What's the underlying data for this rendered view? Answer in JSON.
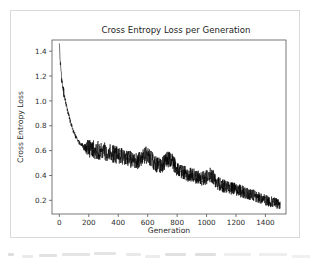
{
  "figure": {
    "background_color": "#ffffff",
    "border_color": "#d9d9d9"
  },
  "chart_data": {
    "type": "line",
    "title": "Cross Entropy Loss per Generation",
    "xlabel": "Generation",
    "ylabel": "Cross Entropy Loss",
    "xlim": [
      -50,
      1540
    ],
    "ylim": [
      0.09,
      1.49
    ],
    "xticks": [
      0,
      200,
      400,
      600,
      800,
      1000,
      1200,
      1400
    ],
    "xticklabels": [
      "0",
      "200",
      "400",
      "600",
      "800",
      "1000",
      "1200",
      "1400"
    ],
    "yticks": [
      0.2,
      0.4,
      0.6,
      0.8,
      1.0,
      1.2,
      1.4
    ],
    "yticklabels": [
      "0.2",
      "0.4",
      "0.6",
      "0.8",
      "1.0",
      "1.2",
      "1.4"
    ],
    "grid": false,
    "legend": false,
    "line_color": "#000000",
    "series": [
      {
        "name": "Cross Entropy Loss",
        "description": "Noisy loss curve: sharp exponential decay from ~1.45 at generation 0 to ~0.63 near generation 150, then a slow noisy linear decline to ~0.16 at generation 1500.",
        "trend_anchors": [
          {
            "x": 0,
            "y": 1.45
          },
          {
            "x": 10,
            "y": 1.22
          },
          {
            "x": 25,
            "y": 1.1
          },
          {
            "x": 40,
            "y": 1.0
          },
          {
            "x": 60,
            "y": 0.9
          },
          {
            "x": 80,
            "y": 0.81
          },
          {
            "x": 100,
            "y": 0.74
          },
          {
            "x": 125,
            "y": 0.68
          },
          {
            "x": 150,
            "y": 0.645
          },
          {
            "x": 200,
            "y": 0.615
          },
          {
            "x": 300,
            "y": 0.59
          },
          {
            "x": 400,
            "y": 0.56
          },
          {
            "x": 500,
            "y": 0.52
          },
          {
            "x": 600,
            "y": 0.495
          },
          {
            "x": 700,
            "y": 0.465
          },
          {
            "x": 800,
            "y": 0.43
          },
          {
            "x": 900,
            "y": 0.4
          },
          {
            "x": 1000,
            "y": 0.36
          },
          {
            "x": 1100,
            "y": 0.32
          },
          {
            "x": 1200,
            "y": 0.285
          },
          {
            "x": 1300,
            "y": 0.245
          },
          {
            "x": 1400,
            "y": 0.2
          },
          {
            "x": 1500,
            "y": 0.165
          }
        ],
        "noise_amplitude": 0.055,
        "noise_start_x": 140,
        "bumps": [
          {
            "x": 600,
            "y": 0.065,
            "width": 40
          },
          {
            "x": 750,
            "y": 0.075,
            "width": 45
          },
          {
            "x": 1030,
            "y": 0.05,
            "width": 35
          }
        ],
        "x_start": 0,
        "x_end": 1500,
        "n_points": 1500
      }
    ]
  },
  "footer": {
    "note": "illegible cropped text"
  }
}
